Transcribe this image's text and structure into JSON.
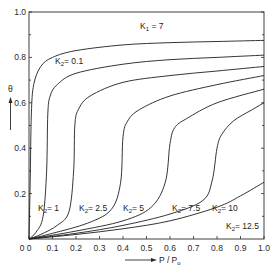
{
  "chart_data": {
    "type": "line",
    "title": "",
    "xlabel": "P / P0",
    "ylabel": "θ",
    "xlim": [
      0,
      1.0
    ],
    "ylim": [
      0,
      1.0
    ],
    "grid": false,
    "legend": "inline annotations",
    "x_ticks": [
      "0",
      "0.1",
      "0.2",
      "0.3",
      "0.4",
      "0.5",
      "0.6",
      "0.7",
      "0.8",
      "0.9",
      "1.0"
    ],
    "y_ticks": [
      "0.2",
      "0.4",
      "0.6",
      "0.8",
      "1.0"
    ],
    "annotations": [
      "K1 = 7",
      "K2 = 0.1",
      "K2 = 1",
      "K2 = 2.5",
      "K2 = 5",
      "K2 = 7.5",
      "K2 = 10",
      "K2 = 12.5"
    ],
    "series": [
      {
        "name": "K2 = 0.1",
        "points": [
          [
            0,
            0
          ],
          [
            0.005,
            0.25
          ],
          [
            0.01,
            0.55
          ],
          [
            0.02,
            0.68
          ],
          [
            0.05,
            0.76
          ],
          [
            0.1,
            0.8
          ],
          [
            0.2,
            0.83
          ],
          [
            0.4,
            0.855
          ],
          [
            0.6,
            0.865
          ],
          [
            0.8,
            0.87
          ],
          [
            1.0,
            0.875
          ]
        ]
      },
      {
        "name": "K2 = 1",
        "points": [
          [
            0,
            0
          ],
          [
            0.03,
            0.03
          ],
          [
            0.06,
            0.1
          ],
          [
            0.075,
            0.3
          ],
          [
            0.08,
            0.55
          ],
          [
            0.09,
            0.63
          ],
          [
            0.12,
            0.68
          ],
          [
            0.2,
            0.73
          ],
          [
            0.4,
            0.77
          ],
          [
            0.6,
            0.79
          ],
          [
            0.8,
            0.8
          ],
          [
            1.0,
            0.81
          ]
        ]
      },
      {
        "name": "K2 = 2.5",
        "points": [
          [
            0,
            0
          ],
          [
            0.05,
            0.02
          ],
          [
            0.12,
            0.06
          ],
          [
            0.17,
            0.12
          ],
          [
            0.19,
            0.3
          ],
          [
            0.195,
            0.5
          ],
          [
            0.21,
            0.57
          ],
          [
            0.26,
            0.63
          ],
          [
            0.4,
            0.69
          ],
          [
            0.6,
            0.72
          ],
          [
            0.8,
            0.74
          ],
          [
            1.0,
            0.76
          ]
        ]
      },
      {
        "name": "K2 = 5",
        "points": [
          [
            0,
            0
          ],
          [
            0.1,
            0.025
          ],
          [
            0.25,
            0.07
          ],
          [
            0.35,
            0.13
          ],
          [
            0.39,
            0.25
          ],
          [
            0.4,
            0.45
          ],
          [
            0.42,
            0.52
          ],
          [
            0.47,
            0.57
          ],
          [
            0.6,
            0.63
          ],
          [
            0.8,
            0.68
          ],
          [
            1.0,
            0.72
          ]
        ]
      },
      {
        "name": "K2 = 7.5",
        "points": [
          [
            0,
            0
          ],
          [
            0.2,
            0.035
          ],
          [
            0.4,
            0.08
          ],
          [
            0.52,
            0.14
          ],
          [
            0.58,
            0.25
          ],
          [
            0.6,
            0.42
          ],
          [
            0.62,
            0.49
          ],
          [
            0.67,
            0.53
          ],
          [
            0.8,
            0.6
          ],
          [
            1.0,
            0.66
          ]
        ]
      },
      {
        "name": "K2 = 10",
        "points": [
          [
            0,
            0
          ],
          [
            0.2,
            0.025
          ],
          [
            0.4,
            0.06
          ],
          [
            0.6,
            0.11
          ],
          [
            0.74,
            0.17
          ],
          [
            0.78,
            0.26
          ],
          [
            0.8,
            0.4
          ],
          [
            0.82,
            0.46
          ],
          [
            0.87,
            0.52
          ],
          [
            0.95,
            0.57
          ],
          [
            1.0,
            0.6
          ]
        ]
      },
      {
        "name": "K2 = 12.5",
        "points": [
          [
            0,
            0
          ],
          [
            0.2,
            0.02
          ],
          [
            0.4,
            0.045
          ],
          [
            0.6,
            0.08
          ],
          [
            0.8,
            0.14
          ],
          [
            0.9,
            0.19
          ],
          [
            1.0,
            0.25
          ]
        ]
      }
    ]
  },
  "labels": {
    "k1": "K",
    "k1_sub": "1",
    "k1_val": " = 7",
    "y_axis": "θ",
    "x_axis": "P / P",
    "x_axis_sub": "o",
    "origin": "0",
    "k2_prefix": "K",
    "k2_sub": "2",
    "k2_vals": [
      "= 0.1",
      "= 1",
      "= 2.5",
      "= 5",
      "= 7.5",
      "= 10",
      "= 12.5"
    ]
  }
}
